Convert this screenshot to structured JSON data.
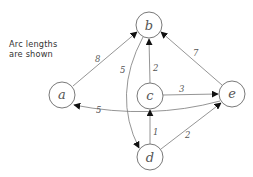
{
  "caption": {
    "line1": "Arc  lengths",
    "line2": "are shown"
  },
  "graph": {
    "nodes": [
      {
        "id": "a",
        "label": "a",
        "cx": 62,
        "cy": 95,
        "r": 13
      },
      {
        "id": "b",
        "label": "b",
        "cx": 149,
        "cy": 25,
        "r": 13
      },
      {
        "id": "c",
        "label": "c",
        "cx": 150,
        "cy": 96,
        "r": 13
      },
      {
        "id": "d",
        "label": "d",
        "cx": 150,
        "cy": 157,
        "r": 13
      },
      {
        "id": "e",
        "label": "e",
        "cx": 232,
        "cy": 94,
        "r": 13
      }
    ],
    "edges": [
      {
        "from": "a",
        "to": "b",
        "length": "8"
      },
      {
        "from": "b",
        "to": "d",
        "length": "5"
      },
      {
        "from": "c",
        "to": "b",
        "length": "2"
      },
      {
        "from": "c",
        "to": "e",
        "length": "3"
      },
      {
        "from": "e",
        "to": "b",
        "length": "7"
      },
      {
        "from": "e",
        "to": "a",
        "length": "5"
      },
      {
        "from": "d",
        "to": "c",
        "length": "1"
      },
      {
        "from": "d",
        "to": "e",
        "length": "2"
      }
    ]
  },
  "colors": {
    "stroke": "#7a7a7a",
    "arrowhead": "#111111",
    "text": "#555555"
  }
}
